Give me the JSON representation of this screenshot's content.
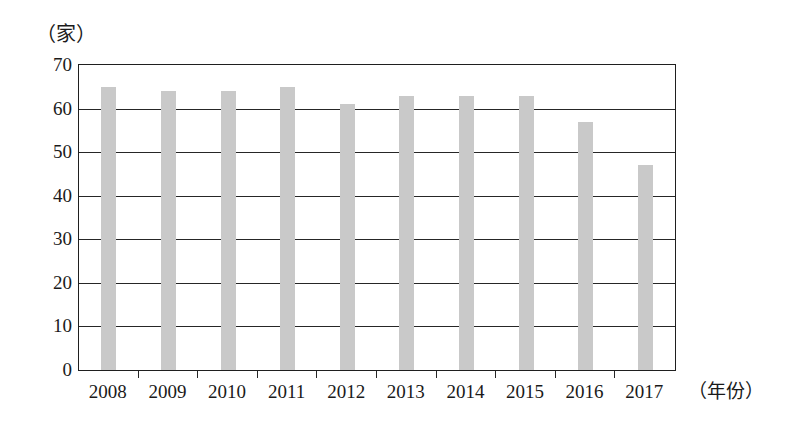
{
  "figure": {
    "y_unit_label": "（家）",
    "x_unit_label": "（年份）"
  },
  "chart_data": {
    "type": "bar",
    "title": "",
    "subtitle": "",
    "xlabel": "（年份）",
    "ylabel": "（家）",
    "categories": [
      "2008",
      "2009",
      "2010",
      "2011",
      "2012",
      "2013",
      "2014",
      "2015",
      "2016",
      "2017"
    ],
    "values": [
      65,
      64,
      64,
      65,
      61,
      63,
      63,
      63,
      57,
      47
    ],
    "series": [
      {
        "name": "",
        "values": [
          65,
          64,
          64,
          65,
          61,
          63,
          63,
          63,
          57,
          47
        ]
      }
    ],
    "ylim": [
      0,
      70
    ],
    "y_ticks": [
      0,
      10,
      20,
      30,
      40,
      50,
      60,
      70
    ],
    "y_tick_labels": [
      "0",
      "10",
      "20",
      "30",
      "40",
      "50",
      "60",
      "70"
    ],
    "grid": true,
    "grid_axis": "y",
    "legend": false,
    "legend_position": "none",
    "bar_color": "#c9c9c9",
    "axis_color": "#262626",
    "background_color": "#ffffff"
  }
}
